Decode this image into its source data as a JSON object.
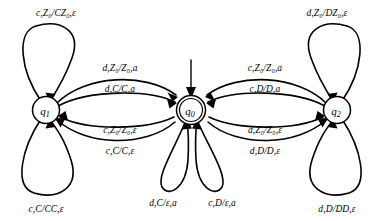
{
  "diagram": {
    "type": "pushdown-automaton-state-diagram",
    "states": [
      {
        "id": "q1",
        "label": "q",
        "sub": "1",
        "cx": 46,
        "cy": 110,
        "accepting": false,
        "start": false
      },
      {
        "id": "q0",
        "label": "q",
        "sub": "0",
        "cx": 191,
        "cy": 110,
        "accepting": true,
        "start": true
      },
      {
        "id": "q2",
        "label": "q",
        "sub": "2",
        "cx": 337,
        "cy": 110,
        "accepting": false,
        "start": false
      }
    ],
    "transitions": [
      {
        "id": "t-q1-self-top",
        "from": "q1",
        "to": "q1",
        "input": "c",
        "pop": "Z0",
        "push": "CZ0",
        "output": "ε",
        "text": "c,Z₀/CZ₀,ε",
        "lx": 56,
        "ly": 14
      },
      {
        "id": "t-q1-self-bottom",
        "from": "q1",
        "to": "q1",
        "input": "c",
        "pop": "C",
        "push": "CC",
        "output": "ε",
        "text": "c,C/CC,ε",
        "lx": 46,
        "ly": 210
      },
      {
        "id": "t-q2-self-top",
        "from": "q2",
        "to": "q2",
        "input": "d",
        "pop": "Z0",
        "push": "DZ0",
        "output": "ε",
        "text": "d,Z₀/DZ₀,ε",
        "lx": 327,
        "ly": 14
      },
      {
        "id": "t-q2-self-bottom",
        "from": "q2",
        "to": "q2",
        "input": "d",
        "pop": "D",
        "push": "DD",
        "output": "ε",
        "text": "d,D/DD,ε",
        "lx": 337,
        "ly": 210
      },
      {
        "id": "t-q0-self-left",
        "from": "q0",
        "to": "q0",
        "input": "d",
        "pop": "C",
        "push": "ε",
        "output": "a",
        "text": "d,C/ε,a",
        "lx": 163,
        "ly": 204
      },
      {
        "id": "t-q0-self-right",
        "from": "q0",
        "to": "q0",
        "input": "c",
        "pop": "D",
        "push": "ε",
        "output": "a",
        "text": "c,D/ε,a",
        "lx": 222,
        "ly": 204
      },
      {
        "id": "t-q1-q0-outer",
        "from": "q1",
        "to": "q0",
        "input": "d",
        "pop": "Z0",
        "push": "Z0",
        "output": "a",
        "text": "d,Z₀/Z₀,a",
        "lx": 120,
        "ly": 69
      },
      {
        "id": "t-q1-q0-inner",
        "from": "q1",
        "to": "q0",
        "input": "d",
        "pop": "C",
        "push": "C",
        "output": "a",
        "text": "d,C/C,a",
        "lx": 120,
        "ly": 90
      },
      {
        "id": "t-q0-q1-inner",
        "from": "q0",
        "to": "q1",
        "input": "c",
        "pop": "Z0",
        "push": "Z0",
        "output": "ε",
        "text": "c,Z₀/Z₀,ε",
        "lx": 120,
        "ly": 131
      },
      {
        "id": "t-q0-q1-outer",
        "from": "q0",
        "to": "q1",
        "input": "c",
        "pop": "C",
        "push": "C",
        "output": "ε",
        "text": "c,C/C,ε",
        "lx": 120,
        "ly": 152
      },
      {
        "id": "t-q2-q0-outer",
        "from": "q2",
        "to": "q0",
        "input": "c",
        "pop": "Z0",
        "push": "Z0",
        "output": "a",
        "text": "c,Z₀/Z₀,a",
        "lx": 265,
        "ly": 69
      },
      {
        "id": "t-q2-q0-inner",
        "from": "q2",
        "to": "q0",
        "input": "c",
        "pop": "D",
        "push": "D",
        "output": "a",
        "text": "c,D/D,a",
        "lx": 265,
        "ly": 90
      },
      {
        "id": "t-q0-q2-inner",
        "from": "q0",
        "to": "q2",
        "input": "d",
        "pop": "Z0",
        "push": "Z0",
        "output": "ε",
        "text": "d,Z₀/Z₀,ε",
        "lx": 265,
        "ly": 131
      },
      {
        "id": "t-q0-q2-outer",
        "from": "q0",
        "to": "q2",
        "input": "d",
        "pop": "D",
        "push": "D",
        "output": "ε",
        "text": "d,D/D,ε",
        "lx": 265,
        "ly": 152
      }
    ],
    "start_arrow": {
      "id": "start-arrow",
      "target": "q0",
      "from_y": 60,
      "to_y": 96
    },
    "colors": {
      "stroke": "#000000",
      "fill": "#ffffff",
      "background": "#ffffff"
    }
  }
}
